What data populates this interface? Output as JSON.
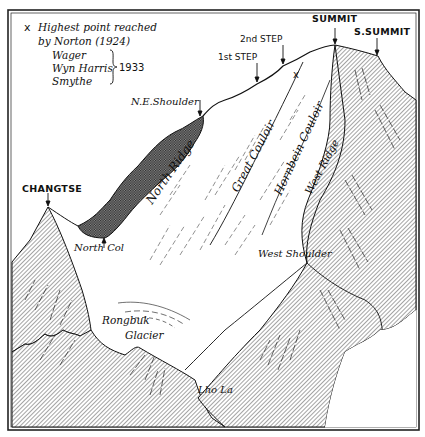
{
  "legend": {
    "marker": "x",
    "line1": "Highest point reached",
    "line2": "by Norton (1924)",
    "names": [
      "Wager",
      "Wyn Harris",
      "Smythe"
    ],
    "year": "1933"
  },
  "labels": {
    "summit": "SUMMIT",
    "south_summit": "S.SUMMIT",
    "second_step": "2nd STEP",
    "first_step": "1st STEP",
    "ne_shoulder": "N.E.Shoulder",
    "changtse": "CHANGTSE",
    "north_col": "North Col",
    "north_ridge": "North Ridge",
    "great_couloir": "Great Couloir",
    "hornbein_couloir": "Hornbein Couloir",
    "west_ridge": "West Ridge",
    "west_shoulder": "West Shoulder",
    "rongbuk_glacier_1": "Rongbuk",
    "rongbuk_glacier_2": "Glacier",
    "lho_la": "Lho La",
    "high_point_marker": "x"
  },
  "colors": {
    "ink": "#111111",
    "paper": "#ffffff",
    "hatch": "#555555",
    "dark_hatch": "#333333"
  }
}
